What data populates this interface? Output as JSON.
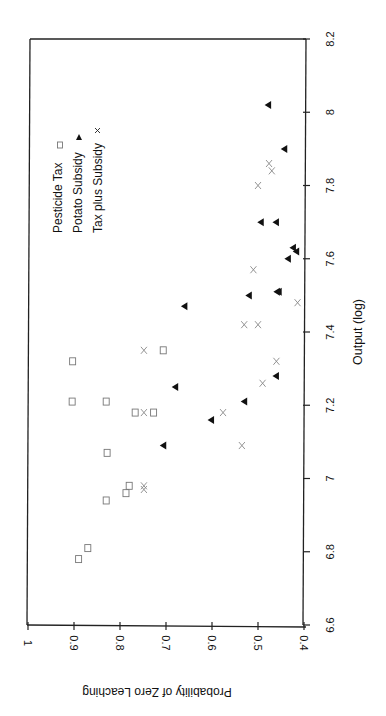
{
  "chart_data": {
    "type": "scatter",
    "title": "",
    "orientation_note": "page rotated 90 degrees; Output axis runs vertically (8.2 at top), probability axis runs horizontally (1 at left, 0.4 at right)",
    "xlabel": "Output (log)",
    "ylabel": "Probability of Zero Leaching",
    "xlim": [
      6.6,
      8.2
    ],
    "ylim": [
      0.4,
      1.0
    ],
    "x_ticks": [
      "6.6",
      "6.8",
      "7",
      "7.2",
      "7.4",
      "7.6",
      "7.8",
      "8",
      "8.2"
    ],
    "y_ticks": [
      "1",
      "0.9",
      "0.8",
      "0.7",
      "0.6",
      "0.5",
      "0.4"
    ],
    "grid": false,
    "legend_position": "upper-left of plot (rotated)",
    "series": [
      {
        "name": "Pesticide Tax",
        "marker": "square",
        "color": "#777777",
        "points": [
          [
            6.78,
            0.89
          ],
          [
            6.81,
            0.87
          ],
          [
            6.94,
            0.83
          ],
          [
            6.96,
            0.787
          ],
          [
            6.98,
            0.78
          ],
          [
            7.07,
            0.828
          ],
          [
            7.18,
            0.767
          ],
          [
            7.18,
            0.727
          ],
          [
            7.21,
            0.904
          ],
          [
            7.21,
            0.83
          ],
          [
            7.32,
            0.903
          ],
          [
            7.35,
            0.706
          ]
        ]
      },
      {
        "name": "Potato Subsidy",
        "marker": "triangle",
        "color": "#111111",
        "points": [
          [
            7.09,
            0.706
          ],
          [
            7.16,
            0.602
          ],
          [
            7.21,
            0.53
          ],
          [
            7.25,
            0.68
          ],
          [
            7.28,
            0.461
          ],
          [
            7.47,
            0.66
          ],
          [
            7.5,
            0.52
          ],
          [
            7.51,
            0.459
          ],
          [
            7.51,
            0.455
          ],
          [
            7.6,
            0.435
          ],
          [
            7.62,
            0.417
          ],
          [
            7.63,
            0.424
          ],
          [
            7.7,
            0.494
          ],
          [
            7.7,
            0.461
          ],
          [
            7.9,
            0.443
          ],
          [
            8.02,
            0.478
          ]
        ]
      },
      {
        "name": "Tax plus Subsidy",
        "marker": "x",
        "color": "#888888",
        "points": [
          [
            6.97,
            0.748
          ],
          [
            6.98,
            0.748
          ],
          [
            7.09,
            0.535
          ],
          [
            7.18,
            0.748
          ],
          [
            7.18,
            0.576
          ],
          [
            7.26,
            0.49
          ],
          [
            7.32,
            0.46
          ],
          [
            7.35,
            0.748
          ],
          [
            7.42,
            0.53
          ],
          [
            7.42,
            0.5
          ],
          [
            7.48,
            0.414
          ],
          [
            7.57,
            0.51
          ],
          [
            7.8,
            0.5
          ],
          [
            7.84,
            0.47
          ],
          [
            7.86,
            0.476
          ]
        ]
      }
    ]
  },
  "legend": {
    "items": [
      {
        "label": "Pesticide Tax",
        "symbol": "□"
      },
      {
        "label": "Potato Subsidy",
        "symbol": "▲"
      },
      {
        "label": "Tax plus Subsidy",
        "symbol": "×"
      }
    ]
  }
}
